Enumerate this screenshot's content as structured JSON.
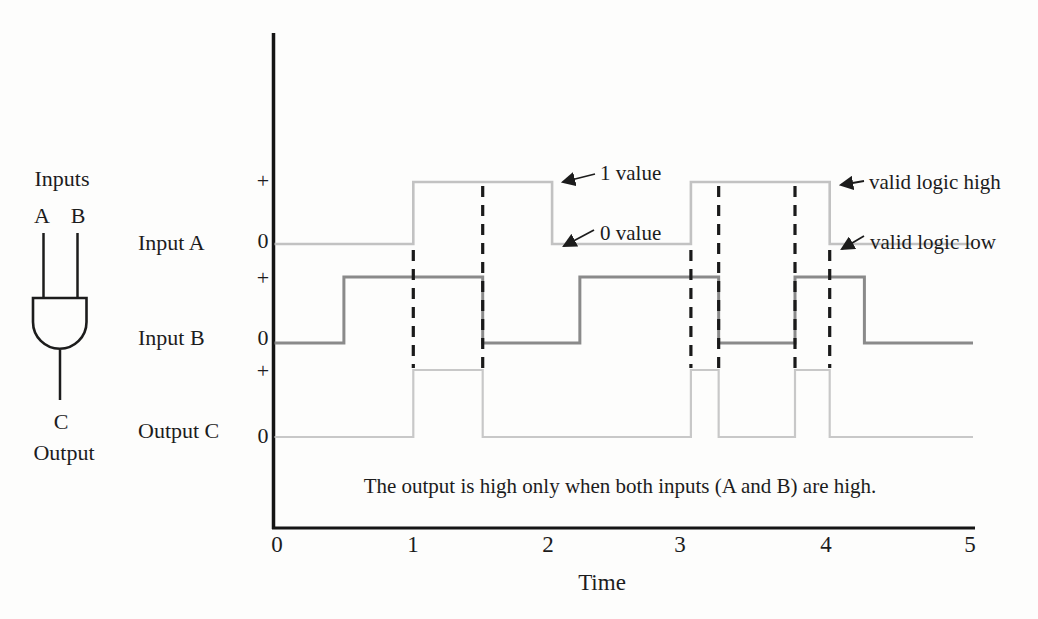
{
  "figure": {
    "gate": {
      "inputs_label": "Inputs",
      "input_a_label": "A",
      "input_b_label": "B",
      "output_pin_label": "C",
      "output_label": "Output"
    },
    "levels": {
      "plus": "+",
      "zero": "0"
    },
    "annotations": {
      "one_value": "1 value",
      "zero_value": "0 value",
      "valid_logic_high": "valid logic high",
      "valid_logic_low": "valid logic low"
    },
    "caption": "The output is high only when both inputs (A and B) are high.",
    "xlabel": "Time"
  },
  "chart_data": {
    "type": "line",
    "subtype": "digital-timing-diagram",
    "title": "",
    "xlabel": "Time",
    "ylabel": "",
    "xlim": [
      0,
      5
    ],
    "x_ticks": [
      0,
      1,
      2,
      3,
      4,
      5
    ],
    "y_levels": [
      "0",
      "+"
    ],
    "grid": false,
    "series": [
      {
        "name": "Input A",
        "color": "#c2c2c2",
        "end": 5,
        "steps": [
          [
            0,
            0
          ],
          [
            1,
            1
          ],
          [
            2,
            0
          ],
          [
            3,
            1
          ],
          [
            4,
            0
          ]
        ]
      },
      {
        "name": "Input B",
        "color": "#8a8a8a",
        "end": 5,
        "steps": [
          [
            0,
            0
          ],
          [
            0.5,
            1
          ],
          [
            1.5,
            0
          ],
          [
            2.2,
            1
          ],
          [
            3.2,
            0
          ],
          [
            3.75,
            1
          ],
          [
            4.25,
            0
          ]
        ]
      },
      {
        "name": "Output C",
        "color": "#c8c8c8",
        "end": 5,
        "steps": [
          [
            0,
            0
          ],
          [
            1,
            1
          ],
          [
            1.5,
            0
          ],
          [
            3,
            1
          ],
          [
            3.2,
            0
          ],
          [
            3.75,
            1
          ],
          [
            4,
            0
          ]
        ]
      }
    ],
    "dashed_guides": [
      {
        "x": 1,
        "extent": "short"
      },
      {
        "x": 1.5,
        "extent": "full"
      },
      {
        "x": 3,
        "extent": "short"
      },
      {
        "x": 3.2,
        "extent": "full"
      },
      {
        "x": 3.75,
        "extent": "full"
      },
      {
        "x": 4,
        "extent": "short"
      }
    ]
  }
}
